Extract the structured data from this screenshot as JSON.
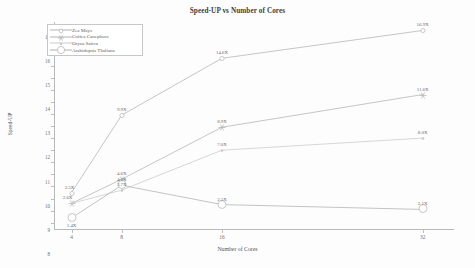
{
  "chart_data": {
    "type": "line",
    "title": "Speed-UP vs Number of Cores",
    "xlabel": "Number of Cores",
    "ylabel": "Speed-UP",
    "x": [
      4,
      8,
      16,
      32
    ],
    "xtick_labels": [
      "4",
      "8",
      "16",
      "32"
    ],
    "ytick_labels": [
      "1",
      "2",
      "3",
      "4",
      "5",
      "6",
      "7",
      "8",
      "9",
      "10",
      "11",
      "12",
      "13",
      "14",
      "15",
      "16",
      "17"
    ],
    "ylim": [
      0.4,
      17.6
    ],
    "xlim": [
      2.6,
      34.5
    ],
    "grid": false,
    "legend_position": "top-left",
    "series": [
      {
        "name": "Zea Mays",
        "marker": "circle-open",
        "color": "#b3b3b3",
        "values": [
          3.5,
          9.9,
          14.6,
          16.9
        ],
        "labels": [
          "3.5X",
          "9.9X",
          "14.6X",
          "16.9X"
        ]
      },
      {
        "name": "Coffea Canephora",
        "marker": "star",
        "color": "#b3b3b3",
        "values": [
          2.6,
          4.6,
          8.9,
          11.6
        ],
        "labels": [
          "2.6X",
          "4.6X",
          "8.9X",
          "11.6X"
        ]
      },
      {
        "name": "Oryza Sativa",
        "marker": "dot",
        "color": "#c9c9c9",
        "values": [
          2.6,
          3.7,
          7.0,
          8.0
        ],
        "labels": [
          "",
          "3.7X",
          "7.0X",
          "8.0X"
        ]
      },
      {
        "name": "Arabidopsis Thaliana",
        "marker": "circle-large-open",
        "color": "#b0b0b0",
        "values": [
          1.4,
          4.1,
          2.5,
          2.1
        ],
        "labels": [
          "1.4X",
          "4.1X",
          "2.5X",
          "2.1X"
        ]
      }
    ]
  }
}
